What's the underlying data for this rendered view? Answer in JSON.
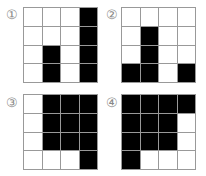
{
  "panels": [
    {
      "label": "①",
      "grid": [
        [
          0,
          0,
          0,
          1
        ],
        [
          0,
          0,
          0,
          1
        ],
        [
          0,
          1,
          0,
          1
        ],
        [
          0,
          1,
          0,
          1
        ]
      ]
    },
    {
      "label": "②",
      "grid": [
        [
          0,
          0,
          0,
          0
        ],
        [
          0,
          1,
          0,
          0
        ],
        [
          0,
          1,
          0,
          0
        ],
        [
          1,
          1,
          0,
          1
        ]
      ]
    },
    {
      "label": "③",
      "grid": [
        [
          0,
          1,
          1,
          1
        ],
        [
          0,
          1,
          1,
          1
        ],
        [
          0,
          1,
          1,
          1
        ],
        [
          0,
          0,
          0,
          1
        ]
      ]
    },
    {
      "label": "④",
      "grid": [
        [
          1,
          1,
          1,
          1
        ],
        [
          1,
          1,
          1,
          0
        ],
        [
          1,
          1,
          1,
          0
        ],
        [
          1,
          0,
          0,
          0
        ]
      ]
    }
  ],
  "colors": {
    "filled": "#000000",
    "empty": "#ffffff",
    "grid_line": "#999999"
  }
}
